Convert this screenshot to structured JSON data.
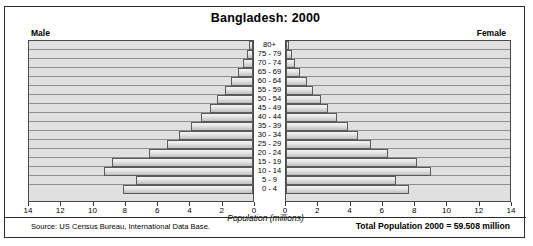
{
  "figure": {
    "title": "Bangladesh: 2000",
    "male_caption": "Male",
    "female_caption": "Female",
    "x_axis_title": "Population (millions)",
    "source_note": "Source: US Census Bureau, International Data Base.",
    "total_population": "Total Population 2000 = 59.508 million",
    "colors": {
      "panel_background": "#e0e0e0",
      "bar_fill": "#d9d9d9",
      "bar_border": "#5a5a5a",
      "frame": "#2a2a2a",
      "text": "#000000"
    }
  },
  "chart_data": {
    "type": "bar",
    "subtype": "population-pyramid",
    "title": "Bangladesh: 2000",
    "xlabel": "Population (millions)",
    "ylabel": "",
    "categories": [
      "80+",
      "75 - 79",
      "70 - 74",
      "65 - 69",
      "60 - 64",
      "55 - 59",
      "50 - 54",
      "45 - 49",
      "40 - 44",
      "35 - 39",
      "30 - 34",
      "25 - 29",
      "20 - 24",
      "15 - 19",
      "10 - 14",
      "5 - 9",
      "0 - 4"
    ],
    "series": [
      {
        "name": "Male",
        "direction": "left",
        "values": [
          0.22,
          0.38,
          0.62,
          0.95,
          1.35,
          1.75,
          2.25,
          2.7,
          3.25,
          3.9,
          4.6,
          5.4,
          6.5,
          8.8,
          9.3,
          7.3,
          8.1
        ]
      },
      {
        "name": "Female",
        "direction": "right",
        "values": [
          0.2,
          0.35,
          0.58,
          0.9,
          1.3,
          1.7,
          2.2,
          2.65,
          3.2,
          3.85,
          4.5,
          5.3,
          6.4,
          8.2,
          9.05,
          6.9,
          7.7
        ]
      }
    ],
    "xlim": [
      0,
      14
    ],
    "xticks": [
      0,
      2,
      4,
      6,
      8,
      10,
      12,
      14
    ],
    "xtick_labels_male": [
      "14",
      "12",
      "10",
      "8",
      "6",
      "4",
      "2",
      "0"
    ],
    "xtick_labels_female": [
      "0",
      "2",
      "4",
      "6",
      "8",
      "10",
      "12",
      "14"
    ],
    "grid": false,
    "legend": "none",
    "annotations": [
      "Source: US Census Bureau, International Data Base.",
      "Total Population 2000 = 59.508 million"
    ]
  }
}
